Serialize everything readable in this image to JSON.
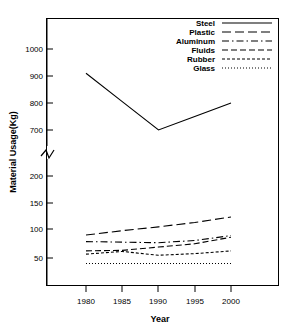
{
  "chart_data": {
    "type": "line",
    "title": "",
    "xlabel": "Year",
    "ylabel": "Material Usage(Kg)",
    "x": [
      1980,
      1985,
      1990,
      1995,
      2000
    ],
    "xlim": [
      1978,
      2001
    ],
    "xticks": [
      "1980",
      "1985",
      "1990",
      "1995",
      "2000"
    ],
    "yticks_upper": [
      "1000",
      "900",
      "800",
      "700"
    ],
    "yticks_lower": [
      "200",
      "150",
      "100",
      "50"
    ],
    "ylim_lower": [
      30,
      200
    ],
    "ylim_upper": [
      650,
      1040
    ],
    "axis_break": true,
    "grid": false,
    "legend_position": "top-right",
    "series": [
      {
        "name": "Steel",
        "style": "solid",
        "values": [
          910,
          805,
          700,
          750,
          800
        ]
      },
      {
        "name": "Plastic",
        "style": "longdash",
        "values": [
          92,
          100,
          107,
          115,
          125
        ]
      },
      {
        "name": "Aluminum",
        "style": "dashdot",
        "values": [
          80,
          79,
          78,
          82,
          91
        ]
      },
      {
        "name": "Fluids",
        "style": "dash",
        "values": [
          63,
          64,
          70,
          76,
          88
        ]
      },
      {
        "name": "Rubber",
        "style": "shortdash",
        "values": [
          57,
          62,
          55,
          58,
          63
        ]
      },
      {
        "name": "Glass",
        "style": "dotted",
        "values": [
          40,
          40,
          40,
          40,
          40
        ]
      }
    ]
  },
  "legend": {
    "items": [
      {
        "label": "Steel"
      },
      {
        "label": "Plastic"
      },
      {
        "label": "Aluminum"
      },
      {
        "label": "Fluids"
      },
      {
        "label": "Rubber"
      },
      {
        "label": "Glass"
      }
    ]
  },
  "axes": {
    "y_title": "Material Usage(Kg)",
    "x_title": "Year",
    "y_tick_labels": [
      "1000",
      "900",
      "800",
      "700",
      "200",
      "150",
      "100",
      "50"
    ],
    "x_tick_labels": [
      "1980",
      "1985",
      "1990",
      "1995",
      "2000"
    ]
  },
  "colors": {
    "ink": "#000000",
    "background": "#ffffff"
  }
}
